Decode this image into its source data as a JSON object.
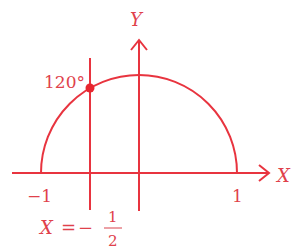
{
  "diagram": {
    "type": "unit-semicircle",
    "colors": {
      "stroke": "#e8343f",
      "text": "#d9434c",
      "point": "#e8262f"
    },
    "axes": {
      "x_label": "X",
      "y_label": "Y",
      "ticks": [
        {
          "value": -1,
          "label": "−1"
        },
        {
          "value": 1,
          "label": "1"
        }
      ]
    },
    "curve": {
      "shape": "upper semicircle",
      "radius": 1,
      "center": [
        0,
        0
      ]
    },
    "vertical_line": {
      "equation_lhs": "X",
      "equation_eq": "=",
      "equation_sign": "−",
      "numerator": "1",
      "denominator": "2",
      "x_value": -0.5
    },
    "point": {
      "angle_label": "120°",
      "angle_deg": 120
    }
  }
}
